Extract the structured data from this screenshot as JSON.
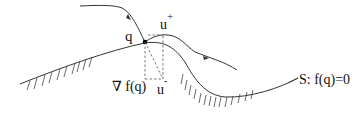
{
  "diagram": {
    "labels": {
      "point_q": "q",
      "u_plus_base": "u",
      "u_plus_sup": "+",
      "u_minus_base": "u",
      "u_minus_sup": "-",
      "gradient": "∇ f(q)",
      "surface": "S: f(q)=0"
    },
    "elements": [
      {
        "type": "surface-curve",
        "name": "S",
        "style": "solid",
        "hatching": "below"
      },
      {
        "type": "trajectory",
        "name": "incoming-trajectory",
        "direction": "down-right toward q"
      },
      {
        "type": "trajectory",
        "name": "outgoing-trajectory",
        "direction": "right away from q"
      },
      {
        "type": "point",
        "name": "q",
        "style": "filled dot"
      },
      {
        "type": "dashed-lines",
        "name": "vector-decomposition",
        "connects": [
          "q",
          "u+",
          "u-",
          "∇f(q)"
        ]
      }
    ],
    "colors": {
      "stroke": "#333333",
      "dashed": "#555555",
      "text": "#111111"
    }
  }
}
